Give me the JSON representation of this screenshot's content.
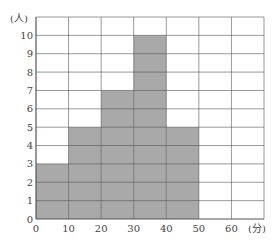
{
  "chart_data": {
    "type": "bar",
    "subtype": "histogram",
    "title": "",
    "xlabel": "(分)",
    "ylabel": "(人)",
    "bins": [
      [
        0,
        10
      ],
      [
        10,
        20
      ],
      [
        20,
        30
      ],
      [
        30,
        40
      ],
      [
        40,
        50
      ],
      [
        50,
        60
      ],
      [
        60,
        70
      ]
    ],
    "categories": [
      "0-10",
      "10-20",
      "20-30",
      "30-40",
      "40-50",
      "50-60",
      "60-70"
    ],
    "values": [
      3,
      5,
      7,
      10,
      5,
      0,
      0
    ],
    "x_ticks": [
      "0",
      "10",
      "20",
      "30",
      "40",
      "50",
      "60"
    ],
    "y_ticks": [
      "0",
      "1",
      "2",
      "3",
      "4",
      "5",
      "6",
      "7",
      "8",
      "9",
      "10"
    ],
    "xlim": [
      0,
      70
    ],
    "ylim": [
      0,
      11
    ],
    "grid": true,
    "legend": null,
    "colors": {
      "bar": "#a9a9a9",
      "grid": "#555555",
      "background": "#ffffff"
    }
  }
}
